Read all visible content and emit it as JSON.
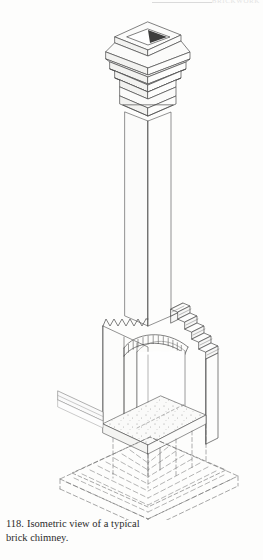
{
  "page": {
    "background_color": "#fdfdfc",
    "ink_color": "#444444",
    "running_head": "BRICKWORK"
  },
  "figure": {
    "number": "118.",
    "caption_line_1": "Isometric view of a",
    "caption_line_2": "typical brick chimney.",
    "full_caption": "118. Isometric view of a typical brick chimney.",
    "drawing_type": "isometric architectural line drawing",
    "subject": "typical brick chimney",
    "line_color": "#4a4a4a",
    "hidden_line_color": "#6b6b6b",
    "shadow_fill": "#3d3d3d",
    "light_face_fill": "#fbfbfa",
    "mid_face_fill": "#f2f2f0"
  },
  "parts": [
    {
      "id": "flue-opening",
      "label": "Flue opening"
    },
    {
      "id": "chimney-cap",
      "label": "Corbelled chimney cap"
    },
    {
      "id": "cap-bands",
      "label": "Corbel bands",
      "count": 3
    },
    {
      "id": "neck-band",
      "label": "Neck band course"
    },
    {
      "id": "chimney-shaft",
      "label": "Chimney shaft"
    },
    {
      "id": "corbel-steps",
      "label": "Stepped corbelling",
      "count": 8
    },
    {
      "id": "toothing",
      "label": "Toothing / raking-out"
    },
    {
      "id": "segmental-arch",
      "label": "Segmental brick arch",
      "voussoirs": 14
    },
    {
      "id": "fireplace-opening",
      "label": "Fireplace opening"
    },
    {
      "id": "hearth-slab",
      "label": "Hearth slab"
    },
    {
      "id": "trimmer-beam",
      "label": "Trimmer beam"
    },
    {
      "id": "footing",
      "label": "Concrete footing (hidden)"
    }
  ]
}
